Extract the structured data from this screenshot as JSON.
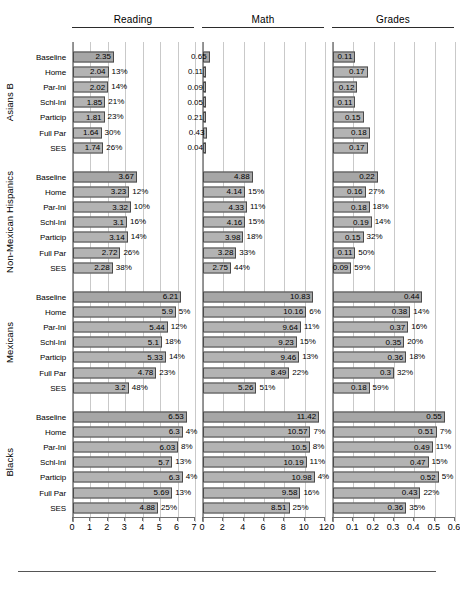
{
  "columns": [
    {
      "label": "Reading",
      "key": "reading",
      "xmin": 0,
      "xmax": 7,
      "ticks": [
        0,
        1,
        2,
        3,
        4,
        5,
        6,
        7
      ],
      "ticklabels": [
        "0",
        "1",
        "2",
        "3",
        "4",
        "5",
        "6",
        "7"
      ]
    },
    {
      "label": "Math",
      "key": "math",
      "xmin": 0,
      "xmax": 12,
      "ticks": [
        0,
        2,
        4,
        6,
        8,
        10,
        12
      ],
      "ticklabels": [
        "0",
        "2",
        "4",
        "6",
        "8",
        "10",
        "12"
      ]
    },
    {
      "label": "Grades",
      "key": "grades",
      "xmin": 0,
      "xmax": 0.6,
      "ticks": [
        0,
        0.1,
        0.2,
        0.3,
        0.4,
        0.5,
        0.6
      ],
      "ticklabels": [
        "0",
        "0.1",
        "0.2",
        "0.3",
        "0.4",
        "0.5",
        "0.6"
      ]
    }
  ],
  "row_labels": [
    "Baseline",
    "Home",
    "Par-Ini",
    "Schl-Ini",
    "Particip",
    "Full Par",
    "SES"
  ],
  "groups": [
    {
      "name": "Asians B"
    },
    {
      "name": "Non-Mexican Hispanics"
    },
    {
      "name": "Mexicans"
    },
    {
      "name": "Blacks"
    }
  ],
  "chart_data": {
    "type": "bar",
    "title": "",
    "orientation": "horizontal",
    "grid": true,
    "legend": false,
    "categories": [
      "Baseline",
      "Home",
      "Par-Ini",
      "Schl-Ini",
      "Particip",
      "Full Par",
      "SES"
    ],
    "panels": [
      {
        "measure": "Reading",
        "xlabel": "",
        "ylabel": "",
        "xlim": [
          0,
          7
        ],
        "xticks": [
          0,
          1,
          2,
          3,
          4,
          5,
          6,
          7
        ]
      },
      {
        "measure": "Math",
        "xlabel": "",
        "ylabel": "",
        "xlim": [
          0,
          12
        ],
        "xticks": [
          0,
          2,
          4,
          6,
          8,
          10,
          12
        ]
      },
      {
        "measure": "Grades",
        "xlabel": "",
        "ylabel": "",
        "xlim": [
          0,
          0.6
        ],
        "xticks": [
          0,
          0.1,
          0.2,
          0.3,
          0.4,
          0.5,
          0.6
        ]
      }
    ],
    "groups": [
      {
        "name": "Asians B",
        "reading": {
          "values": [
            2.35,
            2.04,
            2.02,
            1.85,
            1.81,
            1.64,
            1.74
          ],
          "labels": [
            "2.35",
            "2.04",
            "2.02",
            "1.85",
            "1.81",
            "1.64",
            "1.74"
          ],
          "pct": [
            "",
            "13%",
            "14%",
            "21%",
            "23%",
            "30%",
            "26%"
          ]
        },
        "math": {
          "values": [
            0.65,
            0.11,
            0.09,
            0.05,
            0.21,
            0.43,
            0.04
          ],
          "labels": [
            "0.65",
            "0.11",
            "0.09",
            "0.05",
            "0.21",
            "0.43",
            "0.04"
          ],
          "pct": [
            "",
            "",
            "",
            "",
            "",
            "",
            ""
          ]
        },
        "grades": {
          "values": [
            0.11,
            0.17,
            0.12,
            0.11,
            0.15,
            0.18,
            0.17
          ],
          "labels": [
            "0.11",
            "0.17",
            "0.12",
            "0.11",
            "0.15",
            "0.18",
            "0.17"
          ],
          "pct": [
            "",
            "",
            "",
            "",
            "",
            "",
            ""
          ]
        }
      },
      {
        "name": "Non-Mexican Hispanics",
        "reading": {
          "values": [
            3.67,
            3.23,
            3.32,
            3.1,
            3.14,
            2.72,
            2.28
          ],
          "labels": [
            "3.67",
            "3.23",
            "3.32",
            "3.1",
            "3.14",
            "2.72",
            "2.28"
          ],
          "pct": [
            "",
            "12%",
            "10%",
            "16%",
            "14%",
            "26%",
            "38%"
          ]
        },
        "math": {
          "values": [
            4.88,
            4.14,
            4.33,
            4.16,
            3.98,
            3.28,
            2.75
          ],
          "labels": [
            "4.88",
            "4.14",
            "4.33",
            "4.16",
            "3.98",
            "3.28",
            "2.75"
          ],
          "pct": [
            "",
            "15%",
            "11%",
            "15%",
            "18%",
            "33%",
            "44%"
          ]
        },
        "grades": {
          "values": [
            0.22,
            0.16,
            0.18,
            0.19,
            0.15,
            0.11,
            0.09
          ],
          "labels": [
            "0.22",
            "0.16",
            "0.18",
            "0.19",
            "0.15",
            "0.11",
            "0.09"
          ],
          "pct": [
            "",
            "27%",
            "18%",
            "14%",
            "32%",
            "50%",
            "59%"
          ]
        }
      },
      {
        "name": "Mexicans",
        "reading": {
          "values": [
            6.21,
            5.9,
            5.44,
            5.1,
            5.33,
            4.78,
            3.2
          ],
          "labels": [
            "6.21",
            "5.9",
            "5.44",
            "5.1",
            "5.33",
            "4.78",
            "3.2"
          ],
          "pct": [
            "",
            "5%",
            "12%",
            "18%",
            "14%",
            "23%",
            "48%"
          ]
        },
        "math": {
          "values": [
            10.83,
            10.16,
            9.64,
            9.23,
            9.46,
            8.49,
            5.26
          ],
          "labels": [
            "10.83",
            "10.16",
            "9.64",
            "9.23",
            "9.46",
            "8.49",
            "5.26"
          ],
          "pct": [
            "",
            "6%",
            "11%",
            "15%",
            "13%",
            "22%",
            "51%"
          ]
        },
        "grades": {
          "values": [
            0.44,
            0.38,
            0.37,
            0.35,
            0.36,
            0.3,
            0.18
          ],
          "labels": [
            "0.44",
            "0.38",
            "0.37",
            "0.35",
            "0.36",
            "0.3",
            "0.18"
          ],
          "pct": [
            "",
            "14%",
            "16%",
            "20%",
            "18%",
            "32%",
            "59%"
          ]
        }
      },
      {
        "name": "Blacks",
        "reading": {
          "values": [
            6.53,
            6.3,
            6.03,
            5.7,
            6.3,
            5.69,
            4.88
          ],
          "labels": [
            "6.53",
            "6.3",
            "6.03",
            "5.7",
            "6.3",
            "5.69",
            "4.88"
          ],
          "pct": [
            "",
            "4%",
            "8%",
            "13%",
            "4%",
            "13%",
            "25%"
          ]
        },
        "math": {
          "values": [
            11.42,
            10.57,
            10.5,
            10.19,
            10.98,
            9.58,
            8.51
          ],
          "labels": [
            "11.42",
            "10.57",
            "10.5",
            "10.19",
            "10.98",
            "9.58",
            "8.51"
          ],
          "pct": [
            "",
            "7%",
            "8%",
            "11%",
            "4%",
            "16%",
            "25%"
          ]
        },
        "grades": {
          "values": [
            0.55,
            0.51,
            0.49,
            0.47,
            0.52,
            0.43,
            0.36
          ],
          "labels": [
            "0.55",
            "0.51",
            "0.49",
            "0.47",
            "0.52",
            "0.43",
            "0.36"
          ],
          "pct": [
            "",
            "7%",
            "11%",
            "15%",
            "5%",
            "22%",
            "35%"
          ]
        }
      }
    ]
  }
}
